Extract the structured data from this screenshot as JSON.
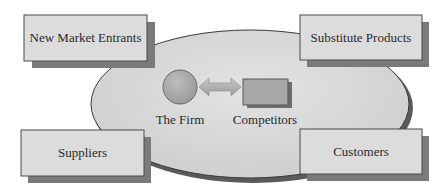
{
  "diagram": {
    "center": {
      "firm_label": "The Firm",
      "competitors_label": "Competitors"
    },
    "forces": [
      {
        "id": "new-market-entrants",
        "label": "New Market Entrants",
        "position": "top-left"
      },
      {
        "id": "substitute-products",
        "label": "Substitute Products",
        "position": "top-right"
      },
      {
        "id": "suppliers",
        "label": "Suppliers",
        "position": "bottom-left"
      },
      {
        "id": "customers",
        "label": "Customers",
        "position": "bottom-right"
      }
    ],
    "colors": {
      "ellipse_fill": "#d9d9d9",
      "ellipse_stroke": "#3a3a3a",
      "box_fill": "#dcdcdc",
      "box_stroke": "#4a4a4a",
      "shadow": "#7a7a7a",
      "shape_fill": "#a9a9a9",
      "arrow_fill": "#b5b5b5"
    }
  }
}
